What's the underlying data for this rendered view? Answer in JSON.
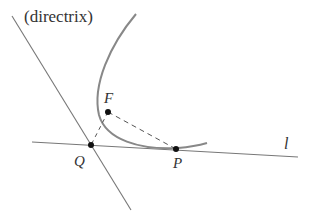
{
  "diagram": {
    "labels": {
      "directrix": "(directrix)",
      "focus": "F",
      "point_q": "Q",
      "point_p": "P",
      "line_l": "l"
    },
    "colors": {
      "lines": "#777777",
      "curve": "#888888",
      "points": "#111111",
      "text": "#333333"
    }
  }
}
